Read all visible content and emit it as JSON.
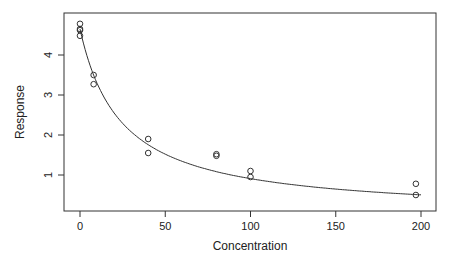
{
  "chart_data": {
    "type": "scatter",
    "title": "",
    "xlabel": "Concentration",
    "ylabel": "Response",
    "xlim": [
      -5,
      205
    ],
    "ylim": [
      0.1,
      4.95
    ],
    "x_ticks": [
      0,
      50,
      100,
      150,
      200
    ],
    "y_ticks": [
      1,
      2,
      3,
      4
    ],
    "grid": false,
    "legend": null,
    "series": [
      {
        "name": "observed",
        "kind": "points",
        "marker": "open-circle",
        "x": [
          0,
          0,
          0,
          0,
          8,
          8,
          40,
          40,
          80,
          80,
          100,
          100,
          197,
          197
        ],
        "y": [
          4.78,
          4.65,
          4.62,
          4.48,
          3.5,
          3.27,
          1.9,
          1.55,
          1.52,
          1.48,
          1.1,
          0.95,
          0.78,
          0.5
        ]
      },
      {
        "name": "fitted curve",
        "kind": "line",
        "model": "y = a / (1 + x / b)",
        "params": {
          "a": 4.65,
          "b": 24.3
        },
        "x_range": [
          0,
          200
        ]
      }
    ]
  }
}
